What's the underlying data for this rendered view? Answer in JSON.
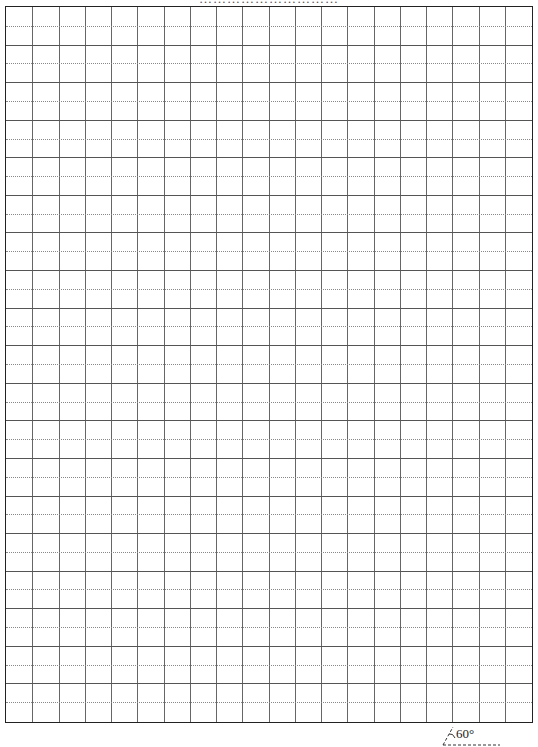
{
  "page": {
    "header_text": "…………………………",
    "header_note": "top caption cropped, unreadable"
  },
  "grid": {
    "columns": 20,
    "rows": 19,
    "row_style": "solid lines with dotted midline in each row",
    "border_color": "#222222",
    "line_color": "#666666",
    "midline_color": "#888888"
  },
  "annotation": {
    "angle_label": "60°",
    "angle_degrees": 60
  }
}
